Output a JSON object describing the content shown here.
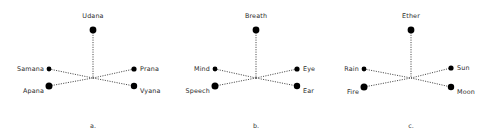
{
  "figure": {
    "background_color": "#ffffff",
    "line_color": "#1a1a1a",
    "dot_color": "#000000",
    "text_color": "#2b2b2b",
    "diagrams": [
      {
        "caption": "a.",
        "nodes": [
          {
            "position": "top",
            "label": "Udana"
          },
          {
            "position": "upper-left",
            "label": "Samana"
          },
          {
            "position": "lower-left",
            "label": "Apana"
          },
          {
            "position": "upper-right",
            "label": "Prana"
          },
          {
            "position": "lower-right",
            "label": "Vyana"
          }
        ]
      },
      {
        "caption": "b.",
        "nodes": [
          {
            "position": "top",
            "label": "Breath"
          },
          {
            "position": "upper-left",
            "label": "Mind"
          },
          {
            "position": "lower-left",
            "label": "Speech"
          },
          {
            "position": "upper-right",
            "label": "Eye"
          },
          {
            "position": "lower-right",
            "label": "Ear"
          }
        ]
      },
      {
        "caption": "c.",
        "nodes": [
          {
            "position": "top",
            "label": "Ether"
          },
          {
            "position": "upper-left",
            "label": "Rain"
          },
          {
            "position": "lower-left",
            "label": "Fire"
          },
          {
            "position": "upper-right",
            "label": "Sun"
          },
          {
            "position": "lower-right",
            "label": "Moon"
          }
        ]
      }
    ]
  }
}
